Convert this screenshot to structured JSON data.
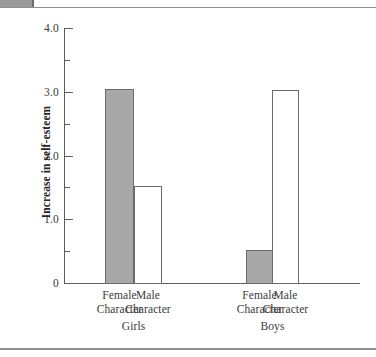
{
  "chart_data": {
    "type": "bar",
    "title": "",
    "xlabel": "",
    "ylabel": "Increase in self-esteem",
    "ylim": [
      0,
      4.0
    ],
    "grid": false,
    "legend_position": "none",
    "groups": [
      "Girls",
      "Boys"
    ],
    "categories": [
      "Female Character",
      "Male Character"
    ],
    "y_ticks": [
      {
        "value": 4.0,
        "label": "4.0",
        "type": "major"
      },
      {
        "value": 3.5,
        "label": "",
        "type": "minor"
      },
      {
        "value": 3.0,
        "label": "3.0",
        "type": "major"
      },
      {
        "value": 2.5,
        "label": "",
        "type": "minor"
      },
      {
        "value": 2.0,
        "label": "2.0",
        "type": "major"
      },
      {
        "value": 1.5,
        "label": "",
        "type": "minor"
      },
      {
        "value": 1.0,
        "label": "1.0",
        "type": "major"
      },
      {
        "value": 0.5,
        "label": "",
        "type": "minor"
      },
      {
        "value": 0.0,
        "label": "0",
        "type": "major"
      }
    ],
    "bars": [
      {
        "group": "Girls",
        "category": "Female Character",
        "value": 3.05,
        "style": "filled",
        "line1": "Female",
        "line2": "Character"
      },
      {
        "group": "Girls",
        "category": "Male Character",
        "value": 1.52,
        "style": "open",
        "line1": "Male",
        "line2": "Character"
      },
      {
        "group": "Boys",
        "category": "Female Character",
        "value": 0.52,
        "style": "filled",
        "line1": "Female",
        "line2": "Character"
      },
      {
        "group": "Boys",
        "category": "Male Character",
        "value": 3.02,
        "style": "open",
        "line1": "Male",
        "line2": "Character"
      }
    ],
    "series": [
      {
        "name": "Female Character",
        "values": [
          3.05,
          0.52
        ]
      },
      {
        "name": "Male Character",
        "values": [
          1.52,
          3.02
        ]
      }
    ],
    "colors": {
      "filled_bar": "#a8a8a8",
      "open_bar": "#ffffff",
      "bar_outline": "#6b6b6b",
      "axis": "#5d5d5d",
      "text": "#3b3b3b",
      "page_rule": "#8e8e8e",
      "tab": "#9a9a9a"
    }
  }
}
